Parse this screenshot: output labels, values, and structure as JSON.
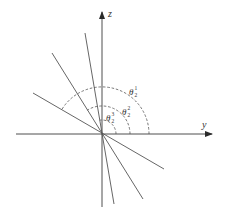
{
  "diagram": {
    "title": "",
    "axes": {
      "horizontal": {
        "label": "y"
      },
      "vertical": {
        "label": "z"
      }
    },
    "lines": [
      {
        "name": "line-1",
        "description": "steepest inclined line through origin"
      },
      {
        "name": "line-2",
        "description": "middle inclined line through origin"
      },
      {
        "name": "line-3",
        "description": "shallowest inclined line through origin"
      }
    ],
    "angles": [
      {
        "symbol": "θ",
        "subscript": "2",
        "superscript": "1",
        "description": "angle from y-axis to shallowest line (largest arc)"
      },
      {
        "symbol": "θ",
        "subscript": "2",
        "superscript": "2",
        "description": "angle from y-axis to middle line"
      },
      {
        "symbol": "θ",
        "subscript": "2",
        "superscript": "3",
        "description": "angle from y-axis to steepest line (smallest arc)"
      }
    ],
    "colors": {
      "background": "#ffffff",
      "ink": "#3a3a3a"
    }
  }
}
